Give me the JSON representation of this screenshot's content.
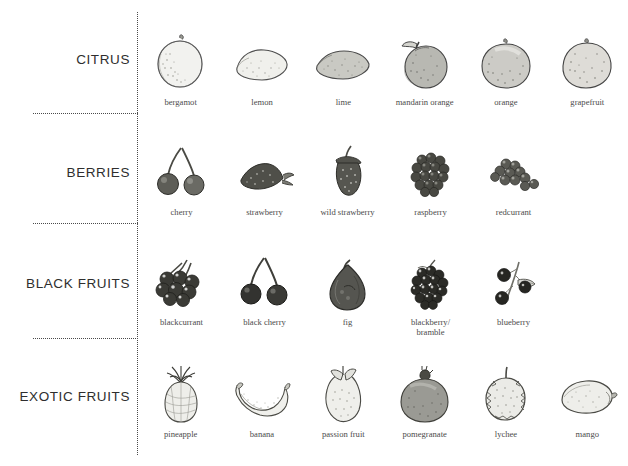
{
  "page": {
    "background_color": "#ffffff",
    "rule_color": "#4a4a4a",
    "caption_color": "#4b4b4b",
    "category_color": "#2e2e2e"
  },
  "categories": [
    {
      "label": "CITRUS",
      "items": [
        {
          "name": "bergamot",
          "icon": "bergamot-illustration"
        },
        {
          "name": "lemon",
          "icon": "lemon-illustration"
        },
        {
          "name": "lime",
          "icon": "lime-illustration"
        },
        {
          "name": "mandarin orange",
          "icon": "mandarin-orange-illustration"
        },
        {
          "name": "orange",
          "icon": "orange-illustration"
        },
        {
          "name": "grapefruit",
          "icon": "grapefruit-illustration"
        }
      ]
    },
    {
      "label": "BERRIES",
      "items": [
        {
          "name": "cherry",
          "icon": "cherry-illustration"
        },
        {
          "name": "strawberry",
          "icon": "strawberry-illustration"
        },
        {
          "name": "wild strawberry",
          "icon": "wild-strawberry-illustration"
        },
        {
          "name": "raspberry",
          "icon": "raspberry-illustration"
        },
        {
          "name": "redcurrant",
          "icon": "redcurrant-illustration"
        }
      ]
    },
    {
      "label": "BLACK FRUITS",
      "items": [
        {
          "name": "blackcurrant",
          "icon": "blackcurrant-illustration"
        },
        {
          "name": "black cherry",
          "icon": "black-cherry-illustration"
        },
        {
          "name": "fig",
          "icon": "fig-illustration"
        },
        {
          "name": "blackberry/\nbramble",
          "icon": "blackberry-illustration"
        },
        {
          "name": "blueberry",
          "icon": "blueberry-illustration"
        }
      ]
    },
    {
      "label": "EXOTIC FRUITS",
      "items": [
        {
          "name": "pineapple",
          "icon": "pineapple-illustration"
        },
        {
          "name": "banana",
          "icon": "banana-illustration"
        },
        {
          "name": "passion fruit",
          "icon": "passion-fruit-illustration"
        },
        {
          "name": "pomegranate",
          "icon": "pomegranate-illustration"
        },
        {
          "name": "lychee",
          "icon": "lychee-illustration"
        },
        {
          "name": "mango",
          "icon": "mango-illustration"
        }
      ]
    }
  ]
}
